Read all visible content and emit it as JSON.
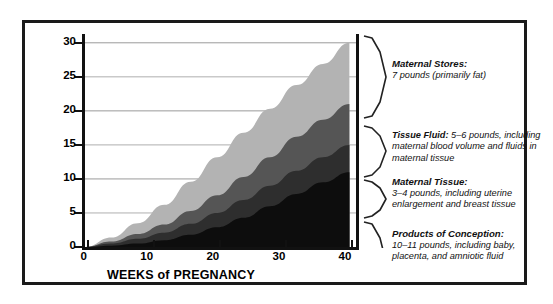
{
  "chart_data": {
    "type": "area",
    "title": "",
    "xlabel": "WEEKS of PREGNANCY",
    "ylabel": "POUNDS",
    "xlim": [
      0,
      41
    ],
    "ylim": [
      0,
      31
    ],
    "xticks": [
      0,
      10,
      20,
      30,
      40
    ],
    "yticks": [
      0,
      5,
      10,
      15,
      20,
      25,
      30
    ],
    "grid": true,
    "stacked": true,
    "legend_position": "right",
    "x": [
      0,
      4,
      8,
      12,
      16,
      20,
      24,
      28,
      32,
      36,
      40
    ],
    "series": [
      {
        "name": "Products of Conception",
        "color": "#0d0d0d",
        "values": [
          0,
          0.2,
          0.5,
          1.0,
          1.8,
          2.9,
          4.3,
          6.0,
          7.8,
          9.5,
          11.0
        ]
      },
      {
        "name": "Maternal Tissue",
        "color": "#2e2e2e",
        "values": [
          0,
          0.3,
          0.7,
          1.1,
          1.6,
          2.1,
          2.6,
          3.0,
          3.4,
          3.7,
          4.0
        ]
      },
      {
        "name": "Tissue Fluid",
        "color": "#555555",
        "values": [
          0,
          0.3,
          0.7,
          1.2,
          1.9,
          2.6,
          3.4,
          4.2,
          5.0,
          5.5,
          6.0
        ]
      },
      {
        "name": "Maternal Stores",
        "color": "#b3b3b3",
        "values": [
          0,
          0.6,
          1.6,
          2.9,
          4.3,
          5.6,
          6.5,
          7.1,
          7.6,
          8.2,
          9.0
        ]
      }
    ],
    "totals": [
      0,
      1.4,
      3.5,
      6.2,
      9.6,
      13.2,
      16.8,
      20.3,
      23.8,
      26.9,
      30.0
    ]
  },
  "axes": {
    "y_title": "POUNDS",
    "x_title": "WEEKS of PREGNANCY",
    "y_labels": [
      "30",
      "25",
      "20",
      "15",
      "10",
      "5",
      "0"
    ],
    "x_labels": [
      "0",
      "10",
      "20",
      "30",
      "40"
    ]
  },
  "legend": {
    "entries": [
      {
        "id": "maternal-stores",
        "heading": "Maternal Stores:",
        "body": "7 pounds (primarily fat)",
        "inline": false
      },
      {
        "id": "tissue-fluid",
        "heading": "Tissue Fluid:",
        "body": "5–6 pounds, including maternal blood volume and fluids in maternal tissue",
        "inline": true
      },
      {
        "id": "maternal-tissue",
        "heading": "Maternal Tissue:",
        "body": "3–4 pounds, including uterine enlargement and breast tissue",
        "inline": false
      },
      {
        "id": "products-of-conception",
        "heading": "Products of Conception:",
        "body": "10–11 pounds, including baby, placenta, and amniotic fluid",
        "inline": false
      }
    ]
  },
  "colors": {
    "band_maternal_stores": "#b3b3b3",
    "band_tissue_fluid": "#555555",
    "band_maternal_tissue": "#2e2e2e",
    "band_products_of_conception": "#0d0d0d",
    "frame": "#1a1a1a",
    "gridline": "#9a9a9a"
  }
}
